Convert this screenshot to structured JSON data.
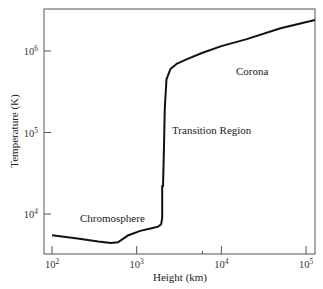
{
  "chart_data": {
    "type": "line",
    "title": "",
    "xlabel": "Height (km)",
    "ylabel": "Temperature (K)",
    "xscale": "log",
    "yscale": "log",
    "xlim": [
      90,
      130000
    ],
    "ylim": [
      3500,
      3500000
    ],
    "grid": false,
    "x_ticks": [
      {
        "value": 100,
        "base": "10",
        "exp": "2"
      },
      {
        "value": 1000,
        "base": "10",
        "exp": "3"
      },
      {
        "value": 10000,
        "base": "10",
        "exp": "4"
      },
      {
        "value": 100000,
        "base": "10",
        "exp": "5"
      }
    ],
    "y_ticks": [
      {
        "value": 10000,
        "base": "10",
        "exp": "4"
      },
      {
        "value": 100000,
        "base": "10",
        "exp": "5"
      },
      {
        "value": 1000000,
        "base": "10",
        "exp": "6"
      }
    ],
    "series": [
      {
        "name": "Solar atmosphere temperature profile",
        "x": [
          100,
          200,
          350,
          500,
          600,
          800,
          1100,
          1500,
          1800,
          1950,
          2000,
          2000,
          2050,
          2050,
          2100,
          2150,
          2250,
          2500,
          3000,
          4000,
          6000,
          10000,
          20000,
          50000,
          130000
        ],
        "y": [
          5500,
          5000,
          4600,
          4400,
          4500,
          5500,
          6200,
          6700,
          7000,
          7500,
          9000,
          22000,
          22000,
          24000,
          60000,
          200000,
          450000,
          600000,
          700000,
          800000,
          950000,
          1150000,
          1400000,
          1900000,
          2400000
        ]
      }
    ],
    "annotations": [
      {
        "text": "Chromosphere",
        "x": 400,
        "y": 8500
      },
      {
        "text": "Transition Region",
        "x": 2800,
        "y": 100000
      },
      {
        "text": "Corona",
        "x": 9000,
        "y": 1500000
      }
    ]
  }
}
